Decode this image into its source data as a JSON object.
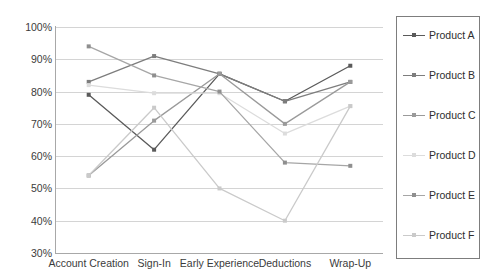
{
  "chart_data": {
    "type": "line",
    "title": "",
    "xlabel": "",
    "ylabel": "",
    "categories": [
      "Account Creation",
      "Sign-In",
      "Early Experience",
      "Deductions",
      "Wrap-Up"
    ],
    "ylim": [
      30,
      100
    ],
    "ytick_labels": [
      "100%",
      "90%",
      "80%",
      "70%",
      "60%",
      "50%",
      "40%",
      "30%"
    ],
    "ytick_values": [
      100,
      90,
      80,
      70,
      60,
      50,
      40,
      30
    ],
    "grid": true,
    "legend_position": "right",
    "value_suffix": "%",
    "series": [
      {
        "name": "Product A",
        "color": "#5a5a5a",
        "values": [
          79,
          62,
          85.5,
          77,
          88
        ]
      },
      {
        "name": "Product B",
        "color": "#7d7d7d",
        "values": [
          83,
          91,
          85.5,
          77,
          83
        ]
      },
      {
        "name": "Product C",
        "color": "#9a9a9a",
        "values": [
          54,
          71,
          85.5,
          70,
          83
        ]
      },
      {
        "name": "Product D",
        "color": "#dcdcdc",
        "values": [
          82,
          79.5,
          79.5,
          67,
          75.5
        ]
      },
      {
        "name": "Product E",
        "color": "#a6a6a6",
        "values": [
          94,
          85,
          80,
          58,
          57
        ]
      },
      {
        "name": "Product F",
        "color": "#cacaca",
        "values": [
          54,
          75,
          50,
          40,
          75.5
        ]
      }
    ]
  },
  "legend": {
    "entries": [
      {
        "label": "Product A"
      },
      {
        "label": "Product B"
      },
      {
        "label": "Product C"
      },
      {
        "label": "Product D"
      },
      {
        "label": "Product E"
      },
      {
        "label": "Product F"
      }
    ]
  }
}
